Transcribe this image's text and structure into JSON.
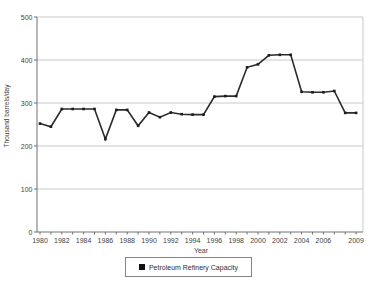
{
  "chart_data": {
    "type": "line",
    "title": "",
    "xlabel": "Year",
    "ylabel": "Thousand barrels/day",
    "x": [
      1980,
      1981,
      1982,
      1983,
      1984,
      1985,
      1986,
      1987,
      1988,
      1989,
      1990,
      1991,
      1992,
      1993,
      1994,
      1995,
      1996,
      1997,
      1998,
      1999,
      2000,
      2001,
      2002,
      2003,
      2004,
      2005,
      2006,
      2007,
      2008,
      2009
    ],
    "series": [
      {
        "name": "Petroleum Refinery Capacity",
        "values": [
          252,
          245,
          286,
          286,
          286,
          286,
          216,
          284,
          284,
          247,
          278,
          267,
          278,
          274,
          273,
          273,
          315,
          316,
          316,
          383,
          390,
          411,
          412,
          412,
          326,
          325,
          325,
          328,
          277,
          277
        ]
      }
    ],
    "ylim": [
      0,
      500
    ],
    "yticks": [
      0,
      100,
      200,
      300,
      400,
      500
    ],
    "xtick_labels": [
      "1980",
      "1982",
      "1984",
      "1986",
      "1988",
      "1990",
      "1992",
      "1994",
      "1996",
      "1998",
      "2000",
      "2002",
      "2004",
      "2006",
      "2009"
    ],
    "grid": "horizontal gridlines on, plot box border on",
    "legend_position": "bottom-center, boxed",
    "colors": {
      "line": "#2b2b2b",
      "marker": "#1c1c1c",
      "grid": "#c9c9c9",
      "axis": "#707070",
      "text": "#3f3f3f",
      "legend_border": "#858585",
      "background": "#ffffff"
    }
  }
}
